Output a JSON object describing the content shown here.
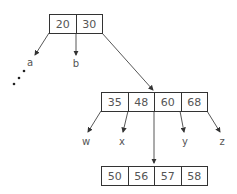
{
  "diagram": {
    "type": "b-tree",
    "root": {
      "keys": [
        "20",
        "30"
      ]
    },
    "internal": {
      "keys": [
        "35",
        "48",
        "60",
        "68"
      ]
    },
    "leaf": {
      "keys": [
        "50",
        "56",
        "57",
        "58"
      ]
    },
    "root_children_labels": [
      "a",
      "b"
    ],
    "internal_children_labels": [
      "w",
      "x",
      "y",
      "z"
    ],
    "ellipsis": "⋰"
  }
}
